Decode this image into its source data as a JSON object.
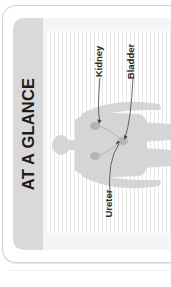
{
  "panel": {
    "title": "AT A GLANCE",
    "colors": {
      "card_border": "#d4d4d4",
      "side_strip": "#d9d9d9",
      "stripe_line": "#e8e8e8",
      "silhouette": "#d0d0d0",
      "organ": "#b8b8b8",
      "arrow": "#444444"
    }
  },
  "diagram": {
    "labels": {
      "kidney": "Kidney",
      "bladder": "Bladder",
      "ureter": "Ureter"
    }
  }
}
